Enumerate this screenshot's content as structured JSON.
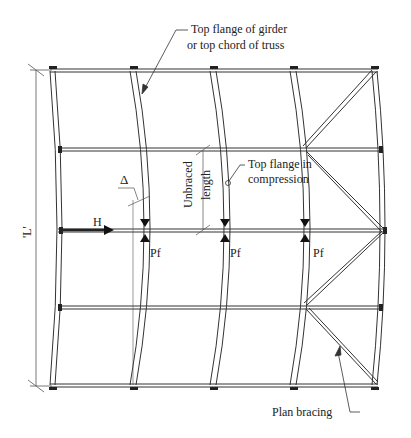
{
  "diagram": {
    "type": "structural plan - lateral torsional buckling of top flange",
    "labels": {
      "top_flange_line1": "Top flange of girder",
      "top_flange_line2": "or top chord of truss",
      "unbraced_line1": "Unbraced",
      "unbraced_line2": "length",
      "compression_line1": "Top flange in",
      "compression_line2": "compression",
      "delta": "Δ",
      "force_h": "H",
      "pf1": "Pf",
      "pf2": "Pf",
      "pf3": "Pf",
      "span": "'L'",
      "plan_bracing": "Plan bracing"
    },
    "colors": {
      "line": "#333333",
      "text": "#222222",
      "background": "#ffffff"
    }
  }
}
